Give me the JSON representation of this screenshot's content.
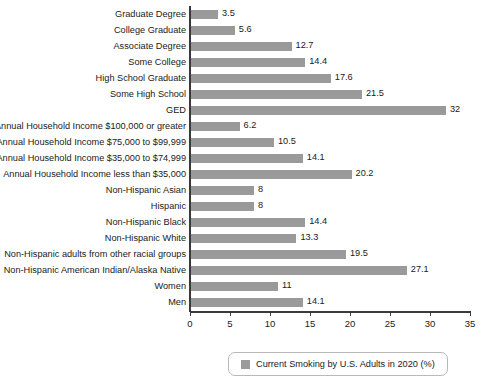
{
  "chart_data": {
    "type": "bar",
    "orientation": "horizontal",
    "title": "",
    "subtitle": "",
    "xlabel": "",
    "ylabel": "",
    "xlim": [
      0,
      35
    ],
    "xticks": [
      0,
      5,
      10,
      15,
      20,
      25,
      30,
      35
    ],
    "xtick_labels": [
      "0",
      "5",
      "10",
      "15",
      "20",
      "25",
      "30",
      "35"
    ],
    "grid": false,
    "legend_position": "bottom",
    "series_name": "Current Smoking by U.S. Adults in 2020 (%)",
    "bar_color": "#9a9a9a",
    "categories": [
      "Graduate Degree",
      "College Graduate",
      "Associate Degree",
      "Some College",
      "High School Graduate",
      "Some High School",
      "GED",
      "Annual Household Income $100,000 or greater",
      "Annual Household Income $75,000 to $99,999",
      "Annual Household Income $35,000 to $74,999",
      "Annual Household Income less than $35,000",
      "Non-Hispanic Asian",
      "Hispanic",
      "Non-Hispanic Black",
      "Non-Hispanic White",
      "Non-Hispanic adults from other racial groups",
      "Non-Hispanic American Indian/Alaska Native",
      "Women",
      "Men"
    ],
    "values": [
      3.5,
      5.6,
      12.7,
      14.4,
      17.6,
      21.5,
      32,
      6.2,
      10.5,
      14.1,
      20.2,
      8,
      8,
      14.4,
      13.3,
      19.5,
      27.1,
      11,
      14.1
    ],
    "value_labels": [
      "3.5",
      "5.6",
      "12.7",
      "14.4",
      "17.6",
      "21.5",
      "32",
      "6.2",
      "10.5",
      "14.1",
      "20.2",
      "8",
      "8",
      "14.4",
      "13.3",
      "19.5",
      "27.1",
      "11",
      "14.1"
    ]
  },
  "legend": {
    "swatch_color": "#9a9a9a",
    "label": "Current Smoking by U.S. Adults in 2020 (%)"
  }
}
